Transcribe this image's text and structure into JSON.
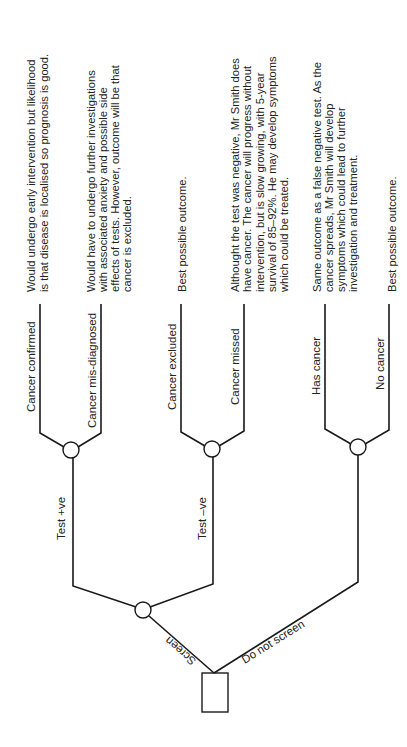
{
  "diagram": {
    "type": "decision-tree",
    "orientation": "rotated-90-ccw",
    "root": {
      "label": "",
      "shape": "decision-square"
    },
    "branches": {
      "screen": "Screen",
      "do_not_screen": "Do not screen",
      "test_pos": "Test +ve",
      "test_neg": "Test –ve"
    },
    "terminals": [
      {
        "label": "Cancer confirmed",
        "outcome": [
          "Would undergo early intervention but likelihood",
          "is that disease is localised so prognosis is good."
        ]
      },
      {
        "label": "Cancer mis-diagnosed",
        "outcome": [
          "Would have to undergo further investigations",
          "with associated anxiety and possible side",
          "effects of tests. However, outcome will be that",
          "cancer is excluded."
        ]
      },
      {
        "label": "Cancer excluded",
        "outcome": [
          "Best possible outcome."
        ]
      },
      {
        "label": "Cancer missed",
        "outcome": [
          "Althought the test was negative, Mr Smith does",
          "have cancer. The cancer will progress without",
          "intervention, but is slow growing, with 5-year",
          "survival of 85–92%. He may develop symptoms",
          "which could be treated."
        ]
      },
      {
        "label": "Has cancer",
        "outcome": [
          "Same outcome as a false negative test. As the",
          "cancer spreads, Mr Smith will develop",
          "symptoms which could lead to further",
          "investigation and treatment."
        ]
      },
      {
        "label": "No cancer",
        "outcome": [
          "Best possible outcome."
        ]
      }
    ],
    "colors": {
      "line": "#1a1a1a",
      "text": "#222222",
      "background": "#ffffff"
    }
  }
}
